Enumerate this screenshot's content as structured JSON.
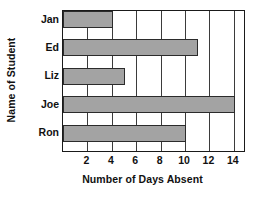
{
  "chart_data": {
    "type": "bar",
    "orientation": "horizontal",
    "title": "",
    "xlabel": "Number of Days Absent",
    "ylabel": "Name of Student",
    "categories": [
      "Jan",
      "Ed",
      "Liz",
      "Joe",
      "Ron"
    ],
    "values": [
      4,
      11,
      5,
      14,
      10
    ],
    "xticks": [
      2,
      4,
      6,
      8,
      10,
      12,
      14
    ],
    "xlim": [
      0,
      15
    ],
    "grid": "vertical",
    "legend": "none",
    "bar_fill_color": "#a3a3a3",
    "bar_edge_color": "#2b2b2b",
    "axis_color": "#1a1a1a",
    "background_color": "#ffffff"
  }
}
